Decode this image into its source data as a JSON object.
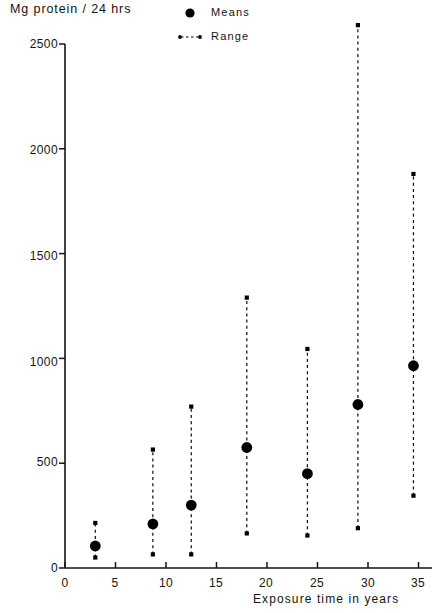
{
  "chart_data": {
    "type": "scatter",
    "title": "",
    "xlabel": "Exposure time in years",
    "ylabel": "Mg protein / 24 hrs",
    "xlim": [
      0,
      35.6
    ],
    "ylim": [
      0,
      2700
    ],
    "grid": false,
    "legend_position": "top-right",
    "legend": [
      {
        "key": "means",
        "label": "Means",
        "marker": "filled-circle"
      },
      {
        "key": "range",
        "label": "Range",
        "marker": "dashed-line-with-end-dots"
      }
    ],
    "xticks": [
      0,
      5,
      10,
      15,
      20,
      25,
      30,
      35
    ],
    "xtick_labels": [
      "0",
      "5",
      "10",
      "15",
      "20",
      "25",
      "30",
      "35"
    ],
    "yticks": [
      0,
      500,
      1000,
      1500,
      2000,
      2500
    ],
    "ytick_labels": [
      "0",
      "500",
      "1000",
      "1500",
      "2000",
      "2500"
    ],
    "series": [
      {
        "name": "Means",
        "marker": "filled-circle",
        "x": [
          3,
          8.7,
          12.5,
          18,
          24,
          29,
          34.5
        ],
        "values": [
          105,
          210,
          300,
          575,
          450,
          780,
          965
        ]
      },
      {
        "name": "Range",
        "marker": "dashed-line-with-end-dots",
        "x": [
          3,
          8.7,
          12.5,
          18,
          24,
          29,
          34.5
        ],
        "low": [
          50,
          65,
          65,
          165,
          155,
          190,
          345
        ],
        "high": [
          215,
          565,
          770,
          1290,
          1045,
          2590,
          1880
        ]
      }
    ],
    "points": [
      {
        "x": 3,
        "mean": 105,
        "low": 50,
        "high": 215
      },
      {
        "x": 8.7,
        "mean": 210,
        "low": 65,
        "high": 565
      },
      {
        "x": 12.5,
        "mean": 300,
        "low": 65,
        "high": 770
      },
      {
        "x": 18,
        "mean": 575,
        "low": 165,
        "high": 1290
      },
      {
        "x": 24,
        "mean": 450,
        "low": 155,
        "high": 1045
      },
      {
        "x": 29,
        "mean": 780,
        "low": 190,
        "high": 2590
      },
      {
        "x": 34.5,
        "mean": 965,
        "low": 345,
        "high": 1880
      }
    ],
    "colors": {
      "ink": "#141414",
      "axis": "#141414",
      "marker": "#000000",
      "background": "#ffffff"
    }
  },
  "axes": {
    "y_title": "Mg protein / 24 hrs",
    "x_title": "Exposure time in years"
  },
  "legend": {
    "means_label": "Means",
    "range_label": "Range"
  },
  "ytick_labels": {
    "t0": "0",
    "t500": "500",
    "t1000": "1000",
    "t1500": "1500",
    "t2000": "2000",
    "t2500": "2500"
  },
  "xtick_labels": {
    "t0": "0",
    "t5": "5",
    "t10": "10",
    "t15": "15",
    "t20": "20",
    "t25": "25",
    "t30": "30",
    "t35": "35"
  }
}
